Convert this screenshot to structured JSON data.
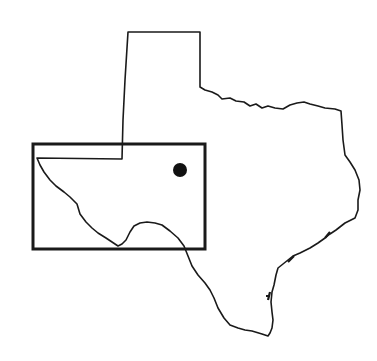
{
  "map": {
    "subject": "Texas state outline",
    "outline_color": "#1a1a1a",
    "background": "#ffffff",
    "inset_rectangle": {
      "x": 33,
      "y": 144,
      "width": 172,
      "height": 105,
      "stroke_width": 3
    },
    "location_marker": {
      "cx": 180,
      "cy": 170,
      "r": 7,
      "color": "#111111"
    }
  }
}
